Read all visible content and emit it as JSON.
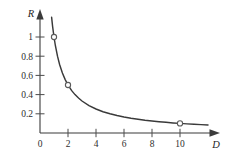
{
  "chart_data": {
    "type": "line",
    "title": "",
    "subtitle": "",
    "xlabel": "D",
    "ylabel": "R",
    "xlim": [
      0,
      12.2
    ],
    "ylim": [
      0,
      1.28
    ],
    "grid": false,
    "legend": "none",
    "relation": "R = 1/D",
    "x_ticks": [
      {
        "value": 0,
        "label": "0"
      },
      {
        "value": 2,
        "label": "2"
      },
      {
        "value": 4,
        "label": "4"
      },
      {
        "value": 6,
        "label": "6"
      },
      {
        "value": 8,
        "label": "8"
      },
      {
        "value": 10,
        "label": "10"
      }
    ],
    "y_ticks": [
      {
        "value": 0.2,
        "label": "0.2"
      },
      {
        "value": 0.4,
        "label": "0.4"
      },
      {
        "value": 0.6,
        "label": "0.6"
      },
      {
        "value": 0.8,
        "label": "0.8"
      },
      {
        "value": 1.0,
        "label": "1"
      }
    ],
    "series": [
      {
        "name": "R = 1/D",
        "x": [
          0.83,
          0.9,
          1.0,
          1.1,
          1.25,
          1.4,
          1.6,
          1.8,
          2.0,
          2.25,
          2.5,
          2.75,
          3.0,
          3.5,
          4.0,
          4.5,
          5.0,
          5.5,
          6.0,
          6.5,
          7.0,
          7.5,
          8.0,
          8.5,
          9.0,
          9.5,
          10.0,
          10.5,
          11.0,
          11.5,
          12.0
        ],
        "y": [
          1.205,
          1.111,
          1.0,
          0.909,
          0.8,
          0.714,
          0.625,
          0.556,
          0.5,
          0.444,
          0.4,
          0.364,
          0.333,
          0.286,
          0.25,
          0.222,
          0.2,
          0.182,
          0.167,
          0.154,
          0.143,
          0.133,
          0.125,
          0.118,
          0.111,
          0.105,
          0.1,
          0.095,
          0.091,
          0.087,
          0.083
        ]
      }
    ],
    "markers": [
      {
        "x": 1,
        "y": 1.0,
        "style": "open-circle"
      },
      {
        "x": 2,
        "y": 0.5,
        "style": "open-circle"
      },
      {
        "x": 10,
        "y": 0.1,
        "style": "open-circle"
      }
    ],
    "colors": {
      "curve": "#3a3a3a",
      "axis": "#3b3b3b",
      "marker_stroke": "#5a5a5a",
      "marker_fill": "#ffffff",
      "background": "#ffffff",
      "text": "#2e2e2e"
    }
  },
  "caption": {
    "sliver_text": ""
  }
}
